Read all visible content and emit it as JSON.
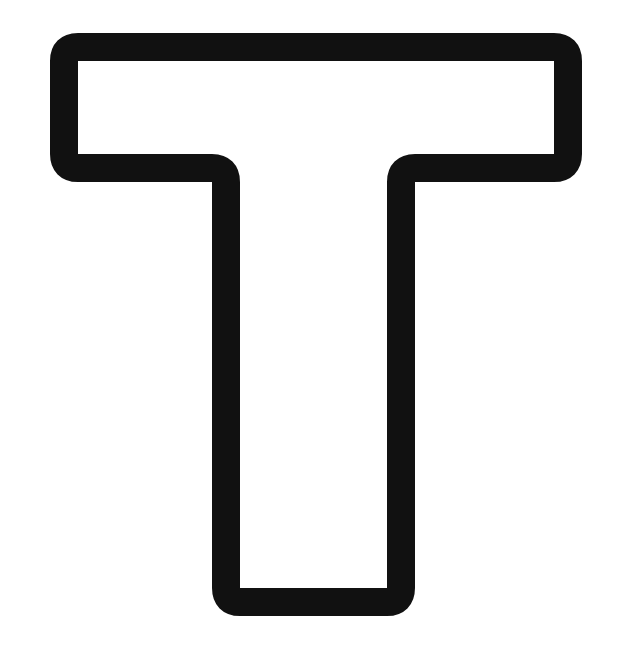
{
  "figure": {
    "letter": "T",
    "style": "outline",
    "stroke_color": "#111111",
    "fill_color": "#ffffff",
    "background": "#ffffff"
  }
}
